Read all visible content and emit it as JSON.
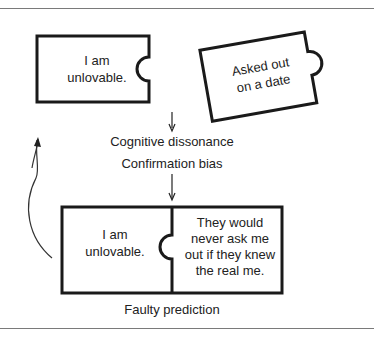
{
  "diagram": {
    "top_piece": {
      "text_line1": "I am",
      "text_line2": "unlovable."
    },
    "tilted_piece": {
      "text_line1": "Asked out",
      "text_line2": "on a date"
    },
    "labels": {
      "cognitive_dissonance": "Cognitive dissonance",
      "confirmation_bias": "Confirmation bias",
      "faulty_prediction": "Faulty prediction"
    },
    "bottom_left_piece": {
      "text_line1": "I am",
      "text_line2": "unlovable."
    },
    "bottom_right_piece": {
      "text_line1": "They would",
      "text_line2": "never ask me",
      "text_line3": "out if they knew",
      "text_line4": "the real me."
    },
    "colors": {
      "stroke": "#1a1a1a",
      "rule": "#7a7a7a"
    }
  }
}
